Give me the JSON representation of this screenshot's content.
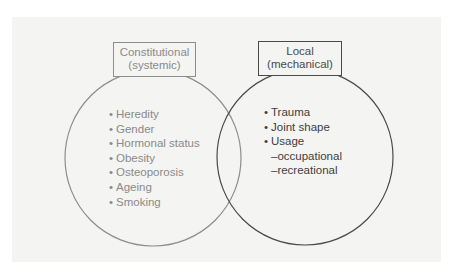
{
  "diagram": {
    "type": "venn",
    "colors": {
      "background": "#ffffff",
      "panel": "#f4f4f2",
      "left_stroke": "#8d8d8d",
      "left_text": "#8a8a8a",
      "right_stroke": "#4a4a4a",
      "right_text": "#3e3e3e"
    },
    "left_set": {
      "label_line1": "Constitutional",
      "label_line2": "(systemic)",
      "items": [
        {
          "bullet": "•",
          "text": "Heredity"
        },
        {
          "bullet": "•",
          "text": "Gender"
        },
        {
          "bullet": "•",
          "text": "Hormonal status"
        },
        {
          "bullet": "•",
          "text": "Obesity"
        },
        {
          "bullet": "•",
          "text": "Osteoporosis"
        },
        {
          "bullet": "•",
          "text": "Ageing"
        },
        {
          "bullet": "•",
          "text": "Smoking"
        }
      ]
    },
    "right_set": {
      "label_line1": "Local",
      "label_line2": "(mechanical)",
      "items": [
        {
          "bullet": "•",
          "text": "Trauma"
        },
        {
          "bullet": "•",
          "text": "Joint shape"
        },
        {
          "bullet": "•",
          "text": "Usage"
        }
      ],
      "sub_items": [
        {
          "text": "–occupational"
        },
        {
          "text": "–recreational"
        }
      ]
    }
  }
}
